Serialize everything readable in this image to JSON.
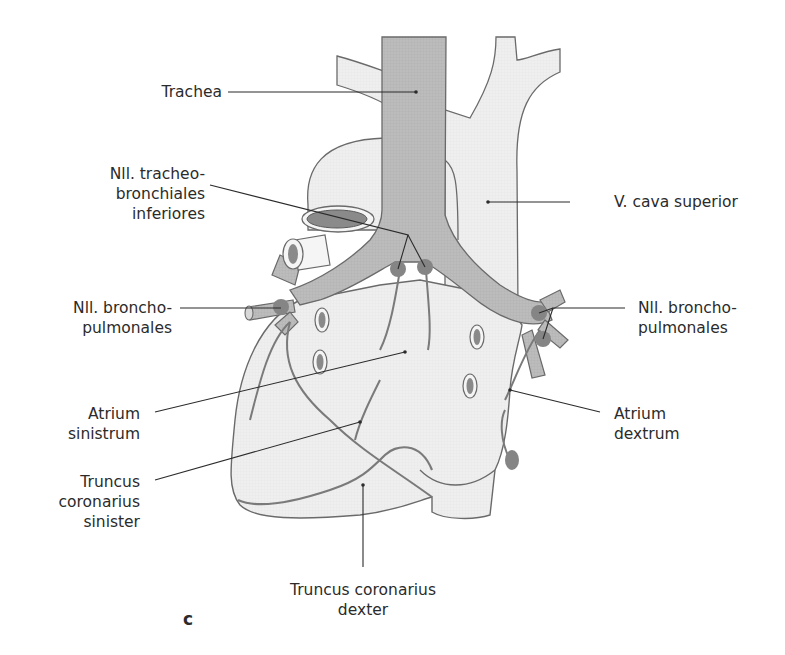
{
  "figure": {
    "panel_letter": "c",
    "colors": {
      "background": "#ffffff",
      "outline": "#6a6a6a",
      "heart_fill": "#eeeeee",
      "airway_fill": "#b8b8b8",
      "lymph_node": "#858585",
      "vessel_lumen": "#8a8a8a",
      "leader_line": "#2b2b2b",
      "text": "#2b2b2b"
    }
  },
  "labels": {
    "trachea": {
      "lines": [
        "Trachea"
      ]
    },
    "nll_tracheobronchiales": {
      "lines": [
        "Nll. tracheo-",
        "bronchiales",
        "inferiores"
      ]
    },
    "v_cava_superior": {
      "lines": [
        "V. cava superior"
      ]
    },
    "nll_bronchopulmonales_left": {
      "lines": [
        "Nll. broncho-",
        "pulmonales"
      ]
    },
    "nll_bronchopulmonales_right": {
      "lines": [
        "Nll. broncho-",
        "pulmonales"
      ]
    },
    "atrium_sinistrum": {
      "lines": [
        "Atrium",
        "sinistrum"
      ]
    },
    "atrium_dextrum": {
      "lines": [
        "Atrium",
        "dextrum"
      ]
    },
    "truncus_coronarius_sinister": {
      "lines": [
        "Truncus",
        "coronarius",
        "sinister"
      ]
    },
    "truncus_coronarius_dexter": {
      "lines": [
        "Truncus coronarius",
        "dexter"
      ]
    }
  }
}
